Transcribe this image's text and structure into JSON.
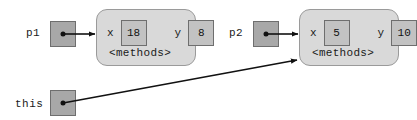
{
  "diagram": {
    "background_color": "#ffffff",
    "line_color": "#111111",
    "object_box_fill": "#d9d9d9",
    "object_box_border": "#9a9a9a",
    "pointer_cell_fill": "#a8a8a8",
    "value_cell_fill": "#c2c2c2",
    "cell_border": "#6e6e6e",
    "variables": [
      {
        "id": "p1",
        "label": "p1",
        "points_to": "object1"
      },
      {
        "id": "p2",
        "label": "p2",
        "points_to": "object2"
      },
      {
        "id": "this",
        "label": "this",
        "points_to": "object2"
      }
    ],
    "objects": [
      {
        "id": "object1",
        "methods_label": "<methods>",
        "fields": [
          {
            "name": "x",
            "value": "18"
          },
          {
            "name": "y",
            "value": "8"
          }
        ]
      },
      {
        "id": "object2",
        "methods_label": "<methods>",
        "fields": [
          {
            "name": "x",
            "value": "5"
          },
          {
            "name": "y",
            "value": "10"
          }
        ]
      }
    ]
  }
}
